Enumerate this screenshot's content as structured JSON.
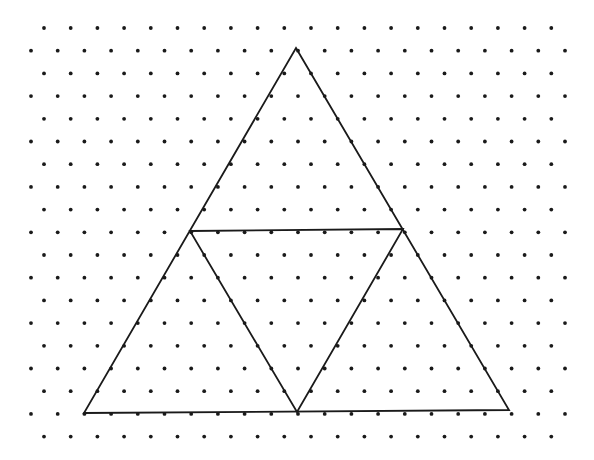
{
  "diagram": {
    "type": "isometric-dot-grid-with-subdivided-triangle",
    "background": "#ffffff",
    "dot_color": "#1a1a1a",
    "line_color": "#1a1a1a",
    "grid": {
      "rows": 19,
      "first_row_y": 28,
      "row_pitch": 22.7,
      "col_pitch": 26.7,
      "even_row_start_x": 44,
      "odd_row_start_x": 31,
      "max_x": 566,
      "dot_radius": 1.9
    },
    "outer_triangle": {
      "apex": [
        296,
        48
      ],
      "bottom_left": [
        84,
        413
      ],
      "bottom_right": [
        509,
        410
      ]
    },
    "inner_triangle": {
      "left": [
        190,
        231
      ],
      "right": [
        403,
        229
      ],
      "bottom": [
        297,
        412
      ]
    }
  }
}
